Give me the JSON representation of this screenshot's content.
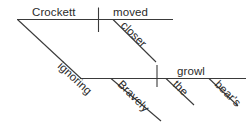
{
  "diagram": {
    "type": "reed-kellogg-sentence-diagram",
    "sentence": "Bravely ignoring the bear's growl, Crockett moved closer.",
    "background_color": "#ffffff",
    "line_color": "#3a3a3a",
    "text_color": "#2b2b2b",
    "words": {
      "subject": "Crockett",
      "verb": "moved",
      "adverb_closer": "closer",
      "participle": "ignoring",
      "adverb_bravely": "Bravely",
      "article_the": "the",
      "possessive": "bear's",
      "object": "growl"
    },
    "structure": {
      "main_clause_baseline": {
        "subject_label": "Crockett",
        "predicate_label": "moved",
        "modifier_label": "closer"
      },
      "participial_phrase_baseline": {
        "participle_label": "ignoring",
        "participle_modifier_label": "Bravely",
        "object_label": "growl",
        "object_modifiers": [
          "the",
          "bear's"
        ]
      }
    }
  }
}
